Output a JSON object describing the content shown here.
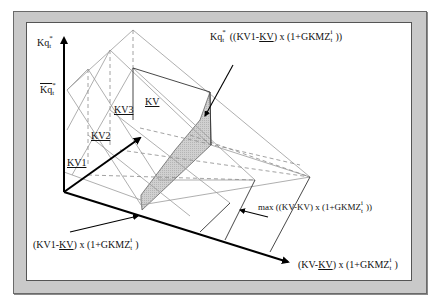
{
  "figure": {
    "frame_color": "#c9c9c9",
    "shade_color": "#c8c8c8",
    "axis_color": "#000000",
    "grid_color": "#9a9a9a"
  },
  "axes": {
    "y_label_main": "Kq",
    "y_label_sup": "*",
    "y_label_sub": "t",
    "y_bar_label_main": "Kq",
    "y_bar_label_sup": "*",
    "y_bar_label_sub": "t",
    "depth_label": "KV",
    "x_label_prefix": "(KV-",
    "x_label_underlined": "KV",
    "x_label_suffix": ") x (1+GKMZ",
    "x_label_sup": "i",
    "x_label_sub": "t",
    "x_label_close": ")"
  },
  "depth_ticks": [
    {
      "label": "KV1"
    },
    {
      "label": "KV2"
    },
    {
      "label": "KV3"
    }
  ],
  "annotations": {
    "top": {
      "prefix_main": "Kq",
      "prefix_sup": "*",
      "prefix_sub": "t",
      "body_a": " ((KV1-",
      "body_underlined": "KV",
      "body_b": ") x (1+GKMZ",
      "sup": "i",
      "sub": "t",
      "close": "))"
    },
    "middle": {
      "text": "max ((KV-KV) x (1+GKMZ",
      "sup": "i",
      "sub": "t",
      "close": "))"
    },
    "bottom_left": {
      "prefix": "(KV1-",
      "underlined": "KV",
      "body": ") x (1+GKMZ",
      "sup": "i",
      "sub": "t",
      "close": ")"
    }
  }
}
